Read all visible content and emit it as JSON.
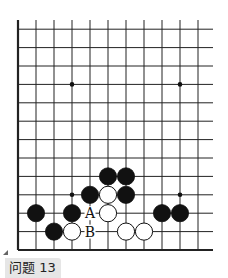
{
  "diagram": {
    "title": "问题 13",
    "board": {
      "columns": 11,
      "rows": 13,
      "origin_x": 18,
      "bottom_y": 250,
      "spacing_x": 18,
      "spacing_y": 18.4,
      "right_extend_x": 213,
      "top_extend_y": 20,
      "edges": [
        "left",
        "bottom"
      ],
      "line_color": "#222222"
    },
    "star_points": [
      {
        "col": 3,
        "row": 9
      },
      {
        "col": 9,
        "row": 9
      },
      {
        "col": 3,
        "row": 3
      },
      {
        "col": 9,
        "row": 3
      }
    ],
    "stones": [
      {
        "color": "black",
        "col": 5,
        "row": 4
      },
      {
        "color": "black",
        "col": 6,
        "row": 4
      },
      {
        "color": "black",
        "col": 4,
        "row": 3
      },
      {
        "color": "white",
        "col": 5,
        "row": 3
      },
      {
        "color": "black",
        "col": 6,
        "row": 3
      },
      {
        "color": "black",
        "col": 1,
        "row": 2
      },
      {
        "color": "black",
        "col": 3,
        "row": 2
      },
      {
        "color": "white",
        "col": 5,
        "row": 2
      },
      {
        "color": "black",
        "col": 8,
        "row": 2
      },
      {
        "color": "black",
        "col": 9,
        "row": 2
      },
      {
        "color": "black",
        "col": 2,
        "row": 1
      },
      {
        "color": "white",
        "col": 3,
        "row": 1
      },
      {
        "color": "white",
        "col": 6,
        "row": 1
      },
      {
        "color": "white",
        "col": 7,
        "row": 1
      }
    ],
    "labels": [
      {
        "text": "A",
        "col": 4,
        "row": 2
      },
      {
        "text": "B",
        "col": 4,
        "row": 1
      }
    ]
  }
}
